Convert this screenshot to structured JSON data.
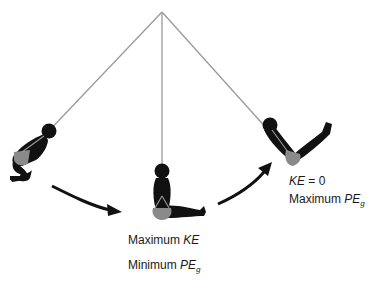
{
  "diagram": {
    "pivot": {
      "x": 162,
      "y": 12
    },
    "positions": [
      {
        "name": "left",
        "rope_end": {
          "x": 48,
          "y": 130
        }
      },
      {
        "name": "bottom",
        "rope_end": {
          "x": 162,
          "y": 172
        },
        "labels": [
          {
            "prefix": "Maximum ",
            "quantity": "KE",
            "subscript": ""
          },
          {
            "prefix": "Minimum ",
            "quantity": "PE",
            "subscript": "g"
          }
        ]
      },
      {
        "name": "right",
        "rope_end": {
          "x": 270,
          "y": 126
        },
        "labels": [
          {
            "prefix": "",
            "quantity": "KE",
            "suffix": " = 0",
            "subscript": ""
          },
          {
            "prefix": "Maximum ",
            "quantity": "PE",
            "subscript": "g"
          }
        ]
      }
    ],
    "colors": {
      "rope": "#9a9a9a",
      "body": "#111111",
      "seat": "#8a8a8a",
      "arrow": "#111111",
      "text": "#1a1a1a"
    }
  },
  "labels": {
    "bottom_line1_prefix": "Maximum ",
    "bottom_line1_qty": "KE",
    "bottom_line2_prefix": "Minimum ",
    "bottom_line2_qty": "PE",
    "bottom_line2_sub": "g",
    "right_line1_qty": "KE",
    "right_line1_suffix": " = 0",
    "right_line2_prefix": "Maximum ",
    "right_line2_qty": "PE",
    "right_line2_sub": "g"
  }
}
